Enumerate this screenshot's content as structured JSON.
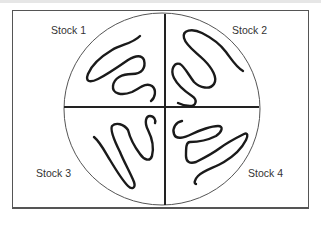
{
  "diagram": {
    "colors": {
      "frame": "#555555",
      "dish_outline": "#555555",
      "dividers": "#222222",
      "streaks": "#1a1a1a",
      "labels": "#333333"
    },
    "quadrants": [
      {
        "label": "Stock 1",
        "position": "top-left"
      },
      {
        "label": "Stock 2",
        "position": "top-right"
      },
      {
        "label": "Stock 3",
        "position": "bottom-left"
      },
      {
        "label": "Stock 4",
        "position": "bottom-right"
      }
    ]
  }
}
